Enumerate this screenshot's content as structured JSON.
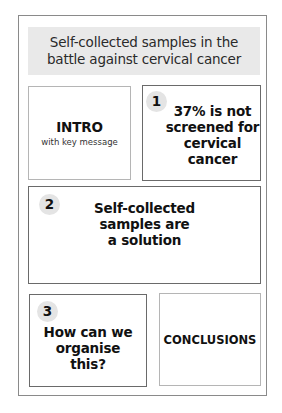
{
  "header": {
    "title_line1": "Self-collected samples in the",
    "title_line2": "battle against cervical cancer"
  },
  "intro": {
    "title": "INTRO",
    "subtitle": "with key message"
  },
  "sections": [
    {
      "number": "1",
      "lines": [
        "37% is not",
        "screened for",
        "cervical",
        "cancer"
      ]
    },
    {
      "number": "2",
      "lines": [
        "Self-collected",
        "samples are",
        "a solution"
      ]
    },
    {
      "number": "3",
      "lines": [
        "How can we",
        "organise",
        "this?"
      ]
    }
  ],
  "conclusions": {
    "title": "CONCLUSIONS"
  },
  "colors": {
    "header_bg": "#e9e9e9",
    "badge_bg": "#e4e4e4",
    "frame_border": "#8a8a8a",
    "box_border_dark": "#6a6a6a",
    "box_border_light": "#b5b5b5"
  }
}
